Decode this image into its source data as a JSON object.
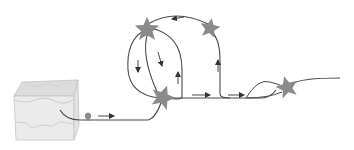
{
  "diagram": {
    "colors": {
      "background": "#ffffff",
      "line": "#4a4a4a",
      "star_fill": "#8a8a8a",
      "skin_fill": "#e6e6e6",
      "skin_top": "#d4d4d4",
      "skin_edge": "#c0c0c0",
      "particle": "#8c8c8c"
    },
    "nodes": [
      {
        "id": "skin-block",
        "type": "tissue-block",
        "x": 45,
        "y": 112
      },
      {
        "id": "particle",
        "type": "circle",
        "x": 88,
        "y": 117
      },
      {
        "id": "star-top-left",
        "type": "star",
        "x": 147,
        "y": 29
      },
      {
        "id": "star-top-right",
        "type": "star",
        "x": 210,
        "y": 28
      },
      {
        "id": "star-center",
        "type": "star",
        "x": 163,
        "y": 97
      },
      {
        "id": "star-right",
        "type": "star",
        "x": 287,
        "y": 87
      }
    ],
    "arrows": [
      {
        "from": "particle",
        "direction": "right"
      },
      {
        "between": "star-top-right -> star-top-left",
        "direction": "left"
      },
      {
        "between": "star-top-left -> star-center (left loop)",
        "direction": "down"
      },
      {
        "between": "star-top-left -> star-center (inner)",
        "direction": "down"
      },
      {
        "between": "star-center -> star-top-left (inner right)",
        "direction": "up"
      },
      {
        "between": "baseline -> star-top-right",
        "direction": "up"
      },
      {
        "between": "star-center -> baseline",
        "direction": "right"
      },
      {
        "between": "baseline -> star-right",
        "direction": "right"
      }
    ]
  }
}
